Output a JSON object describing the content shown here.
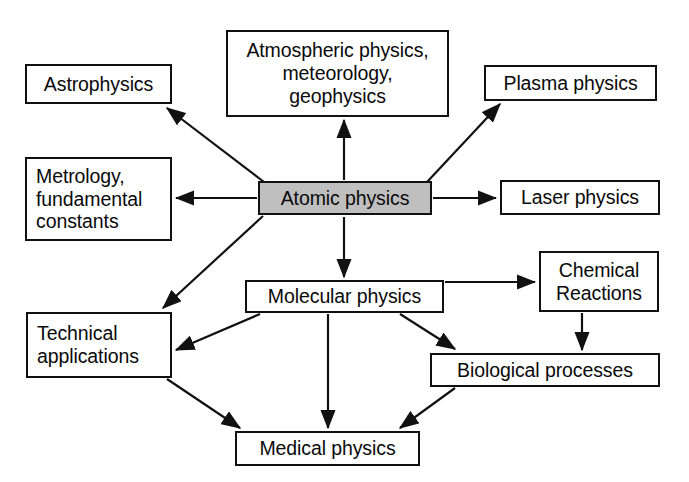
{
  "diagram": {
    "canvas": {
      "width": 689,
      "height": 482,
      "background": "#ffffff"
    },
    "style": {
      "box_border_color": "#111111",
      "box_fill_color": "#ffffff",
      "highlight_fill_color": "#bfbfbf",
      "text_color": "#0a0a0a",
      "arrow_color": "#111111"
    },
    "nodes": [
      {
        "id": "astrophysics",
        "label": "Astrophysics",
        "x": 25,
        "y": 64,
        "w": 147,
        "h": 40,
        "align": "center",
        "highlight": false
      },
      {
        "id": "atmospheric",
        "label": "Atmospheric physics,\nmeteorology,\ngeophysics",
        "x": 226,
        "y": 30,
        "w": 223,
        "h": 87,
        "align": "center",
        "highlight": false
      },
      {
        "id": "plasma",
        "label": "Plasma physics",
        "x": 484,
        "y": 65,
        "w": 173,
        "h": 36,
        "align": "center",
        "highlight": false
      },
      {
        "id": "metrology",
        "label": "Metrology,\nfundamental\nconstants",
        "x": 25,
        "y": 157,
        "w": 147,
        "h": 84,
        "align": "left",
        "highlight": false
      },
      {
        "id": "atomic",
        "label": "Atomic physics",
        "x": 258,
        "y": 181,
        "w": 174,
        "h": 34,
        "align": "center",
        "highlight": true
      },
      {
        "id": "laser",
        "label": "Laser physics",
        "x": 500,
        "y": 180,
        "w": 160,
        "h": 35,
        "align": "center",
        "highlight": false
      },
      {
        "id": "molecular",
        "label": "Molecular physics",
        "x": 245,
        "y": 280,
        "w": 199,
        "h": 33,
        "align": "center",
        "highlight": false
      },
      {
        "id": "chemical",
        "label": "Chemical\nReactions",
        "x": 539,
        "y": 251,
        "w": 120,
        "h": 61,
        "align": "center",
        "highlight": false
      },
      {
        "id": "technical",
        "label": "Technical\napplications",
        "x": 26,
        "y": 312,
        "w": 146,
        "h": 66,
        "align": "left",
        "highlight": false
      },
      {
        "id": "biological",
        "label": "Biological processes",
        "x": 430,
        "y": 353,
        "w": 230,
        "h": 34,
        "align": "center",
        "highlight": false
      },
      {
        "id": "medical",
        "label": "Medical physics",
        "x": 235,
        "y": 431,
        "w": 185,
        "h": 35,
        "align": "center",
        "highlight": false
      }
    ],
    "edges": [
      {
        "id": "atomic-to-astrophysics",
        "from": "atomic",
        "to": "astrophysics",
        "x1": 264,
        "y1": 182,
        "x2": 167,
        "y2": 108
      },
      {
        "id": "atomic-to-atmospheric",
        "from": "atomic",
        "to": "atmospheric",
        "x1": 344,
        "y1": 180,
        "x2": 344,
        "y2": 120
      },
      {
        "id": "atomic-to-plasma",
        "from": "atomic",
        "to": "plasma",
        "x1": 427,
        "y1": 182,
        "x2": 500,
        "y2": 104
      },
      {
        "id": "atomic-to-metrology",
        "from": "atomic",
        "to": "metrology",
        "x1": 257,
        "y1": 198,
        "x2": 176,
        "y2": 198
      },
      {
        "id": "atomic-to-laser",
        "from": "atomic",
        "to": "laser",
        "x1": 433,
        "y1": 198,
        "x2": 496,
        "y2": 198
      },
      {
        "id": "atomic-to-technical",
        "from": "atomic",
        "to": "technical",
        "x1": 263,
        "y1": 216,
        "x2": 163,
        "y2": 308
      },
      {
        "id": "atomic-to-molecular",
        "from": "atomic",
        "to": "molecular",
        "x1": 344,
        "y1": 217,
        "x2": 344,
        "y2": 277
      },
      {
        "id": "molecular-to-chemical",
        "from": "molecular",
        "to": "chemical",
        "x1": 445,
        "y1": 282,
        "x2": 535,
        "y2": 282
      },
      {
        "id": "molecular-to-technical",
        "from": "molecular",
        "to": "technical",
        "x1": 260,
        "y1": 314,
        "x2": 176,
        "y2": 350
      },
      {
        "id": "molecular-to-biological",
        "from": "molecular",
        "to": "biological",
        "x1": 400,
        "y1": 314,
        "x2": 455,
        "y2": 349
      },
      {
        "id": "molecular-to-medical",
        "from": "molecular",
        "to": "medical",
        "x1": 328,
        "y1": 314,
        "x2": 328,
        "y2": 428
      },
      {
        "id": "chemical-to-biological",
        "from": "chemical",
        "to": "biological",
        "x1": 582,
        "y1": 313,
        "x2": 582,
        "y2": 350
      },
      {
        "id": "technical-to-medical",
        "from": "technical",
        "to": "medical",
        "x1": 167,
        "y1": 379,
        "x2": 240,
        "y2": 428
      },
      {
        "id": "biological-to-medical",
        "from": "biological",
        "to": "medical",
        "x1": 455,
        "y1": 388,
        "x2": 400,
        "y2": 428
      }
    ]
  }
}
